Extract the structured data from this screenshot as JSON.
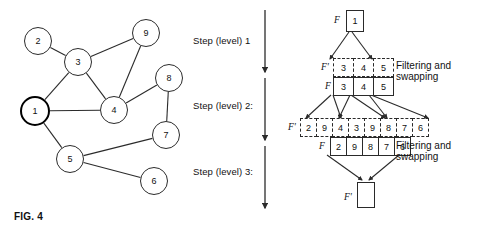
{
  "figure": {
    "caption": "FIG. 4",
    "steps": [
      {
        "label": "Step (level) 1"
      },
      {
        "label": "Step (level) 2:"
      },
      {
        "label": "Step (level) 3:"
      }
    ],
    "annotations": {
      "filtering_line1": "Filtering and",
      "filtering_line2": "swapping"
    },
    "symbols": {
      "f": "F",
      "f_prime": "F'"
    }
  },
  "graph": {
    "nodes": [
      {
        "id": "2",
        "label": "2",
        "cx": 38,
        "cy": 41,
        "r": 14,
        "start": false
      },
      {
        "id": "3",
        "label": "3",
        "cx": 78,
        "cy": 62,
        "r": 14,
        "start": false
      },
      {
        "id": "9",
        "label": "9",
        "cx": 146,
        "cy": 33,
        "r": 14,
        "start": false
      },
      {
        "id": "8",
        "label": "8",
        "cx": 169,
        "cy": 78,
        "r": 14,
        "start": false
      },
      {
        "id": "1",
        "label": "1",
        "cx": 35,
        "cy": 111,
        "r": 15,
        "start": true
      },
      {
        "id": "4",
        "label": "4",
        "cx": 114,
        "cy": 110,
        "r": 14,
        "start": false
      },
      {
        "id": "7",
        "label": "7",
        "cx": 166,
        "cy": 135,
        "r": 14,
        "start": false
      },
      {
        "id": "5",
        "label": "5",
        "cx": 70,
        "cy": 159,
        "r": 14,
        "start": false
      },
      {
        "id": "6",
        "label": "6",
        "cx": 154,
        "cy": 181,
        "r": 14,
        "start": false
      }
    ],
    "edges": [
      [
        "2",
        "3"
      ],
      [
        "3",
        "9"
      ],
      [
        "3",
        "1"
      ],
      [
        "3",
        "4"
      ],
      [
        "9",
        "4"
      ],
      [
        "8",
        "4"
      ],
      [
        "8",
        "7"
      ],
      [
        "1",
        "4"
      ],
      [
        "1",
        "5"
      ],
      [
        "5",
        "7"
      ],
      [
        "5",
        "6"
      ]
    ]
  },
  "pipeline": {
    "levels": [
      {
        "name": "level-0",
        "rows": [
          {
            "symbol": "F",
            "style": "solid",
            "values": [
              "1"
            ]
          }
        ]
      },
      {
        "name": "level-1",
        "rows": [
          {
            "symbol": "F'",
            "style": "dashed",
            "values": [
              "3",
              "4",
              "5"
            ]
          },
          {
            "symbol": "F",
            "style": "solid",
            "values": [
              "3",
              "4",
              "5"
            ]
          }
        ],
        "note": "Filtering and swapping"
      },
      {
        "name": "level-2",
        "rows": [
          {
            "symbol": "F'",
            "style": "dashed",
            "values": [
              "2",
              "9",
              "4",
              "3",
              "9",
              "8",
              "7",
              "6"
            ]
          },
          {
            "symbol": "F",
            "style": "solid",
            "values": [
              "2",
              "9",
              "8",
              "7",
              "6"
            ]
          }
        ],
        "note": "Filtering and swapping"
      },
      {
        "name": "level-3",
        "rows": [
          {
            "symbol": "F'",
            "style": "solid",
            "values": [
              ""
            ]
          }
        ]
      }
    ]
  }
}
